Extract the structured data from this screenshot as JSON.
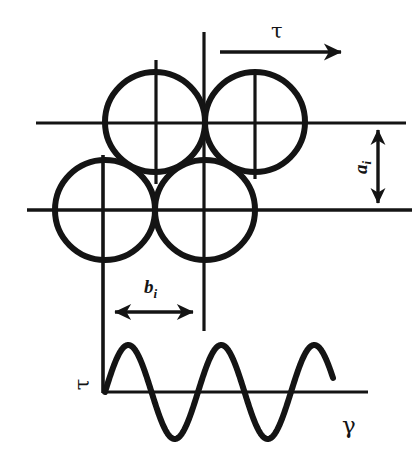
{
  "figure": {
    "stroke_color": "#141414",
    "background_color": "#ffffff",
    "circle_stroke_width": 6,
    "line_stroke_width": 3.2,
    "labels": {
      "shear_stress_top": "τ",
      "shear_stress_axis": "τ",
      "strain_axis": "γ",
      "spacing_vertical_symbol": "a",
      "spacing_vertical_subscript": "i",
      "spacing_horizontal_symbol": "b",
      "spacing_horizontal_subscript": "i"
    },
    "geometry": {
      "circles": [
        {
          "name": "sphere-upper-left",
          "cx": 155,
          "cy": 122,
          "r": 50
        },
        {
          "name": "sphere-upper-right",
          "cx": 255,
          "cy": 122,
          "r": 50
        },
        {
          "name": "sphere-lower-left",
          "cx": 105,
          "cy": 210,
          "r": 50
        },
        {
          "name": "sphere-lower-right",
          "cx": 205,
          "cy": 210,
          "r": 50
        }
      ],
      "horizontal_layer_lines": [
        {
          "name": "layer-line-upper",
          "x1": 36,
          "x2": 406,
          "y": 123
        },
        {
          "name": "layer-line-lower",
          "x1": 27,
          "x2": 412,
          "y": 210
        }
      ],
      "vertical_lines": [
        {
          "name": "column-line-left",
          "x": 103,
          "y1": 155,
          "y2": 393
        },
        {
          "name": "column-line-right",
          "x": 204,
          "y1": 32,
          "y2": 331
        },
        {
          "name": "center-tick-upper-left",
          "x": 156,
          "y1": 60,
          "y2": 184
        },
        {
          "name": "center-tick-upper-right",
          "x": 255,
          "y1": 70,
          "y2": 179
        }
      ],
      "shear_arrow": {
        "x1": 220,
        "x2": 347,
        "y": 52
      },
      "a_dimension_arrow": {
        "x": 378,
        "y1": 123,
        "y2": 210
      },
      "b_dimension_arrow": {
        "y": 312,
        "x1": 112,
        "x2": 196
      },
      "wave_axis": {
        "x1": 103,
        "x2": 368,
        "y": 392
      }
    }
  },
  "chart_data": {
    "type": "line",
    "title": "",
    "xlabel": "γ",
    "ylabel": "τ",
    "xlim": [
      103,
      368
    ],
    "ylim": [
      -47,
      47
    ],
    "grid": false,
    "legend": null,
    "annotations": [
      {
        "text": "τ",
        "role": "y-axis-label",
        "x": 82,
        "y": 383
      },
      {
        "text": "γ",
        "role": "x-axis-label",
        "x": 348,
        "y": 425
      }
    ],
    "series": [
      {
        "name": "shear-stress-waveform",
        "function": "sine",
        "amplitude": 47,
        "period": 93,
        "phase": 0,
        "cycles": 2.45,
        "x_start": 105,
        "x_end": 333,
        "baseline_y": 392,
        "key_points": [
          {
            "x": 105,
            "y": 0,
            "kind": "zero-crossing-rising"
          },
          {
            "x": 128,
            "y": 47,
            "kind": "peak"
          },
          {
            "x": 151,
            "y": 0,
            "kind": "zero-crossing-falling"
          },
          {
            "x": 175,
            "y": -47,
            "kind": "trough"
          },
          {
            "x": 198,
            "y": 0,
            "kind": "zero-crossing-rising"
          },
          {
            "x": 221,
            "y": 47,
            "kind": "peak"
          },
          {
            "x": 244,
            "y": 0,
            "kind": "zero-crossing-falling"
          },
          {
            "x": 268,
            "y": -47,
            "kind": "trough"
          },
          {
            "x": 291,
            "y": 0,
            "kind": "zero-crossing-rising"
          },
          {
            "x": 314,
            "y": 47,
            "kind": "peak"
          },
          {
            "x": 333,
            "y": 0,
            "kind": "zero-crossing-falling"
          }
        ]
      }
    ]
  }
}
